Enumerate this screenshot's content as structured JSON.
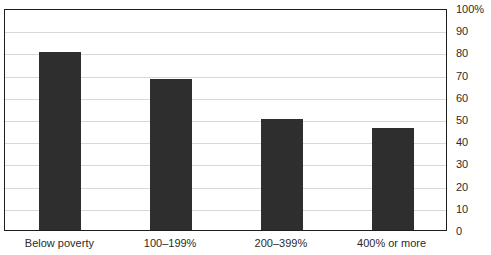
{
  "chart_data": {
    "type": "bar",
    "title": "",
    "title_note": "title row is cropped off the top edge of the screenshot; only letter descenders are visible",
    "categories": [
      "Below poverty",
      "100–199%",
      "200–399%",
      "400% or more"
    ],
    "values": [
      80,
      68,
      50,
      46
    ],
    "series": [
      {
        "name": "",
        "values": [
          80,
          68,
          50,
          46
        ]
      }
    ],
    "xlabel": "",
    "ylabel": "",
    "ylim": [
      0,
      100
    ],
    "yticks": [
      0,
      10,
      20,
      30,
      40,
      50,
      60,
      70,
      80,
      90,
      100
    ],
    "ytick_labels": [
      "0",
      "10",
      "20",
      "30",
      "40",
      "50",
      "60",
      "70",
      "80",
      "90",
      "100%"
    ],
    "grid": true,
    "grid_axis": "y",
    "legend": false,
    "legend_position": "none",
    "axis_position": "right",
    "bar_color": "#2e2e2e",
    "grid_color": "#d8d8d8",
    "frame_color": "#1d1d1d",
    "background_color": "#ffffff"
  }
}
